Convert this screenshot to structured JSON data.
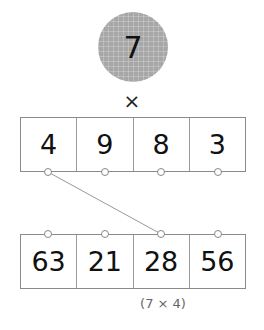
{
  "multiplier": {
    "value": "7",
    "fill": "#a7a7a7"
  },
  "operator": "×",
  "top_row": {
    "cells": [
      "4",
      "9",
      "8",
      "3"
    ]
  },
  "bottom_row": {
    "cells": [
      "63",
      "21",
      "28",
      "56"
    ]
  },
  "connection": {
    "from": "top_row.cells.0",
    "to": "bottom_row.cells.2"
  },
  "note": "(7 × 4)"
}
